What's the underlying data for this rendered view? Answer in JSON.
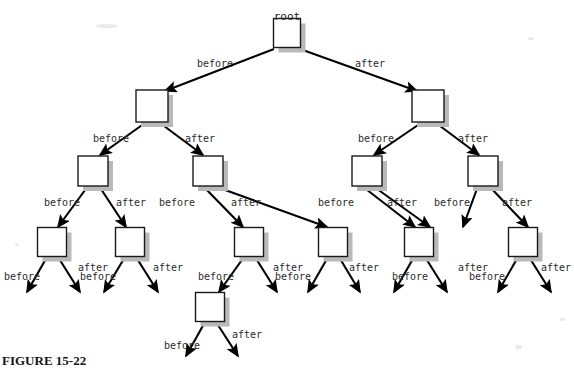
{
  "figure": {
    "caption": "FIGURE 15-22",
    "root_label": "root",
    "label_before": "before",
    "label_after": "after",
    "colors": {
      "background": "#ffffff",
      "node_fill": "#ffffff",
      "node_stroke": "#1a1a1a",
      "node_shadow": "#b9b9b9",
      "edge": "#000000",
      "text": "#2b2b2b"
    },
    "node_stroke_width": 1.4,
    "shadow_offset": 5
  },
  "chart_data": {
    "type": "diagram",
    "title": "FIGURE 15-22",
    "edge_labels": [
      "before",
      "after"
    ],
    "levels": 5,
    "nodes": [
      {
        "id": "root",
        "level": 1,
        "x": 287,
        "y": 33,
        "w": 27,
        "h": 29,
        "label": "root",
        "label_x": 287,
        "label_y": 11
      },
      {
        "id": "n2L",
        "level": 2,
        "x": 152,
        "y": 106,
        "w": 32,
        "h": 32,
        "label": "",
        "label_x": 0,
        "label_y": 0
      },
      {
        "id": "n2R",
        "level": 2,
        "x": 428,
        "y": 106,
        "w": 32,
        "h": 32,
        "label": "",
        "label_x": 0,
        "label_y": 0
      },
      {
        "id": "n3a",
        "level": 3,
        "x": 93,
        "y": 171,
        "w": 30,
        "h": 30,
        "label": "",
        "label_x": 0,
        "label_y": 0
      },
      {
        "id": "n3b",
        "level": 3,
        "x": 208,
        "y": 171,
        "w": 30,
        "h": 30,
        "label": "",
        "label_x": 0,
        "label_y": 0
      },
      {
        "id": "n3c",
        "level": 3,
        "x": 367,
        "y": 171,
        "w": 30,
        "h": 30,
        "label": "",
        "label_x": 0,
        "label_y": 0
      },
      {
        "id": "n3d",
        "level": 3,
        "x": 483,
        "y": 171,
        "w": 30,
        "h": 30,
        "label": "",
        "label_x": 0,
        "label_y": 0
      },
      {
        "id": "n4a",
        "level": 4,
        "x": 52,
        "y": 242,
        "w": 29,
        "h": 29,
        "label": "",
        "label_x": 0,
        "label_y": 0
      },
      {
        "id": "n4b",
        "level": 4,
        "x": 130,
        "y": 242,
        "w": 29,
        "h": 29,
        "label": "",
        "label_x": 0,
        "label_y": 0
      },
      {
        "id": "n4c",
        "level": 4,
        "x": 249,
        "y": 242,
        "w": 29,
        "h": 29,
        "label": "",
        "label_x": 0,
        "label_y": 0
      },
      {
        "id": "n4d",
        "level": 4,
        "x": 333,
        "y": 242,
        "w": 29,
        "h": 29,
        "label": "",
        "label_x": 0,
        "label_y": 0
      },
      {
        "id": "n4e",
        "level": 4,
        "x": 419,
        "y": 242,
        "w": 29,
        "h": 29,
        "label": "",
        "label_x": 0,
        "label_y": 0
      },
      {
        "id": "n4f",
        "level": 4,
        "x": 523,
        "y": 242,
        "w": 29,
        "h": 29,
        "label": "",
        "label_x": 0,
        "label_y": 0
      },
      {
        "id": "n5a",
        "level": 5,
        "x": 210,
        "y": 307,
        "w": 29,
        "h": 29,
        "label": "",
        "label_x": 0,
        "label_y": 0
      }
    ],
    "edges": [
      {
        "from": "root",
        "to": "n2L",
        "label": "before",
        "label_x": 215,
        "label_y": 59,
        "x1": 274,
        "y1": 49,
        "x2": 165,
        "y2": 91
      },
      {
        "from": "root",
        "to": "n2R",
        "label": "after",
        "label_x": 370,
        "label_y": 59,
        "x1": 300,
        "y1": 49,
        "x2": 417,
        "y2": 91
      },
      {
        "from": "n2L",
        "to": "n3a",
        "label": "before",
        "label_x": 111,
        "label_y": 134,
        "x1": 145,
        "y1": 123,
        "x2": 100,
        "y2": 155
      },
      {
        "from": "n2L",
        "to": "n3b",
        "label": "after",
        "label_x": 200,
        "label_y": 134,
        "x1": 160,
        "y1": 123,
        "x2": 203,
        "y2": 155
      },
      {
        "from": "n2R",
        "to": "n3c",
        "label": "before",
        "label_x": 376,
        "label_y": 134,
        "x1": 421,
        "y1": 123,
        "x2": 374,
        "y2": 155
      },
      {
        "from": "n2R",
        "to": "n3d",
        "label": "after",
        "label_x": 473,
        "label_y": 134,
        "x1": 436,
        "y1": 123,
        "x2": 479,
        "y2": 155
      },
      {
        "from": "n3a",
        "to": "n4a",
        "label": "before",
        "label_x": 62,
        "label_y": 198,
        "x1": 88,
        "y1": 186,
        "x2": 58,
        "y2": 227
      },
      {
        "from": "n3a",
        "to": "n4b",
        "label": "after",
        "label_x": 131,
        "label_y": 198,
        "x1": 99,
        "y1": 186,
        "x2": 126,
        "y2": 227
      },
      {
        "from": "n3b",
        "to": "n4c",
        "label": "before",
        "label_x": 177,
        "label_y": 198,
        "x1": 203,
        "y1": 186,
        "x2": 243,
        "y2": 227
      },
      {
        "from": "n3b",
        "to": "n4d",
        "label": "after",
        "label_x": 246,
        "label_y": 198,
        "x1": 214,
        "y1": 186,
        "x2": 327,
        "y2": 227
      },
      {
        "from": "n3c",
        "to": "n4e",
        "label": "before",
        "label_x": 336,
        "label_y": 198,
        "x1": 362,
        "y1": 186,
        "x2": 415,
        "y2": 227
      },
      {
        "from": "n3c",
        "to": "n4f",
        "label": "after",
        "label_x": 402,
        "label_y": 198,
        "x1": 373,
        "y1": 186,
        "x2": 430,
        "y2": 227
      },
      {
        "from": "n3d",
        "to": "n4g",
        "label": "before",
        "label_x": 452,
        "label_y": 198,
        "x1": 478,
        "y1": 186,
        "x2": 463,
        "y2": 227
      },
      {
        "from": "n3d",
        "to": "n4h",
        "label": "after",
        "label_x": 517,
        "label_y": 198,
        "x1": 489,
        "y1": 186,
        "x2": 528,
        "y2": 227
      },
      {
        "from": "n4a",
        "to": "leaf1",
        "label": "before",
        "label_x": 22,
        "label_y": 272,
        "x1": 47,
        "y1": 257,
        "x2": 27,
        "y2": 292
      },
      {
        "from": "n4a",
        "to": "leaf2",
        "label": "after",
        "label_x": 93,
        "label_y": 263,
        "x1": 58,
        "y1": 257,
        "x2": 80,
        "y2": 292
      },
      {
        "from": "n4b",
        "to": "leaf3",
        "label": "before",
        "label_x": 98,
        "label_y": 272,
        "x1": 125,
        "y1": 257,
        "x2": 104,
        "y2": 292
      },
      {
        "from": "n4b",
        "to": "leaf4",
        "label": "after",
        "label_x": 168,
        "label_y": 263,
        "x1": 136,
        "y1": 257,
        "x2": 158,
        "y2": 292
      },
      {
        "from": "n4c",
        "to": "n5a",
        "label": "before",
        "label_x": 216,
        "label_y": 272,
        "x1": 244,
        "y1": 257,
        "x2": 219,
        "y2": 292
      },
      {
        "from": "n4c",
        "to": "leaf5",
        "label": "after",
        "label_x": 288,
        "label_y": 263,
        "x1": 255,
        "y1": 257,
        "x2": 277,
        "y2": 292
      },
      {
        "from": "n4d",
        "to": "leaf6",
        "label": "before",
        "label_x": 293,
        "label_y": 272,
        "x1": 328,
        "y1": 257,
        "x2": 308,
        "y2": 292
      },
      {
        "from": "n4d",
        "to": "leaf7",
        "label": "after",
        "label_x": 364,
        "label_y": 263,
        "x1": 339,
        "y1": 257,
        "x2": 360,
        "y2": 292
      },
      {
        "from": "n4e",
        "to": "leaf8",
        "label": "before",
        "label_x": 410,
        "label_y": 272,
        "x1": 414,
        "y1": 257,
        "x2": 394,
        "y2": 292
      },
      {
        "from": "n4e",
        "to": "leaf9",
        "label": "after",
        "label_x": 473,
        "label_y": 263,
        "x1": 425,
        "y1": 257,
        "x2": 447,
        "y2": 292
      },
      {
        "from": "n4f",
        "to": "leaf10",
        "label": "before",
        "label_x": 487,
        "label_y": 272,
        "x1": 518,
        "y1": 257,
        "x2": 498,
        "y2": 292
      },
      {
        "from": "n4f",
        "to": "leaf11",
        "label": "after",
        "label_x": 556,
        "label_y": 263,
        "x1": 529,
        "y1": 257,
        "x2": 551,
        "y2": 292
      },
      {
        "from": "n5a",
        "to": "leaf12",
        "label": "before",
        "label_x": 182,
        "label_y": 341,
        "x1": 205,
        "y1": 322,
        "x2": 186,
        "y2": 356
      },
      {
        "from": "n5a",
        "to": "leaf13",
        "label": "after",
        "label_x": 247,
        "label_y": 330,
        "x1": 216,
        "y1": 322,
        "x2": 238,
        "y2": 356
      }
    ]
  }
}
